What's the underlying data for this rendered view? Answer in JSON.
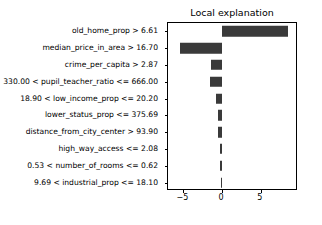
{
  "chart_data": {
    "type": "bar",
    "orientation": "horizontal",
    "title": "Local explanation",
    "xlabel": "",
    "ylabel": "",
    "xlim": [
      -7.0,
      9.8
    ],
    "xticks": [
      -5,
      0,
      5
    ],
    "xticklabels": [
      "−5",
      "0",
      "5"
    ],
    "grid": false,
    "legend": null,
    "bar_color": "#3a3a3a",
    "categories": [
      "old_home_prop > 6.61",
      "median_price_in_area > 16.70",
      "crime_per_capita > 2.87",
      "330.00 < pupil_teacher_ratio <= 666.00",
      "18.90 < low_income_prop <= 20.20",
      "lower_status_prop <= 375.69",
      "distance_from_city_center > 93.90",
      "high_way_access <= 2.08",
      "0.53 < number_of_rooms <= 0.62",
      "9.69 < industrial_prop <= 18.10"
    ],
    "values": [
      8.45,
      -5.45,
      -1.45,
      -1.55,
      -0.85,
      -0.6,
      -0.55,
      -0.3,
      -0.25,
      -0.12
    ]
  }
}
